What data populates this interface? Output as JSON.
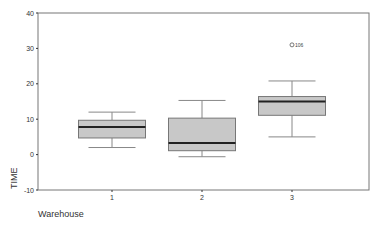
{
  "chart_data": {
    "type": "boxplot",
    "title": "",
    "xlabel": "Warehouse",
    "ylabel": "TIME",
    "ylim": [
      -10,
      40
    ],
    "yticks": [
      -10,
      0,
      10,
      20,
      30,
      40
    ],
    "categories": [
      "1",
      "2",
      "3"
    ],
    "grid": false,
    "legend": null,
    "boxes": [
      {
        "category": "1",
        "whisker_low": 2,
        "q1": 4.7,
        "median": 7.8,
        "q3": 9.7,
        "whisker_high": 12
      },
      {
        "category": "2",
        "whisker_low": -0.6,
        "q1": 1.1,
        "median": 3.3,
        "q3": 10.3,
        "whisker_high": 15.3
      },
      {
        "category": "3",
        "whisker_low": 5,
        "q1": 11.1,
        "median": 15,
        "q3": 16.4,
        "whisker_high": 20.8
      }
    ],
    "outliers": [
      {
        "category": "3",
        "value": 31,
        "label": "106"
      }
    ],
    "colors": {
      "box_fill": "#c8c8c8",
      "median": "#222222",
      "lines": "#888888",
      "axis": "#777777"
    }
  }
}
